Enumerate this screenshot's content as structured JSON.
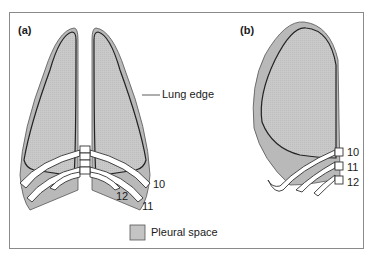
{
  "panels": {
    "a": {
      "label": "(a)"
    },
    "b": {
      "label": "(b)"
    }
  },
  "annotations": {
    "lung_edge": "Lung edge",
    "rib_10_a": "10",
    "rib_11_a": "11",
    "rib_12_a": "12",
    "rib_10_b": "10",
    "rib_11_b": "11",
    "rib_12_b": "12"
  },
  "legend": {
    "label": "Pleural space",
    "swatch_color": "#c4c4c4"
  },
  "colors": {
    "pleura_fill": "#b9b9b9",
    "lung_fill": "#c8c8c8",
    "outline": "#2a2a2a",
    "rib_fill": "#ffffff",
    "frame": "#8a8a8a"
  }
}
